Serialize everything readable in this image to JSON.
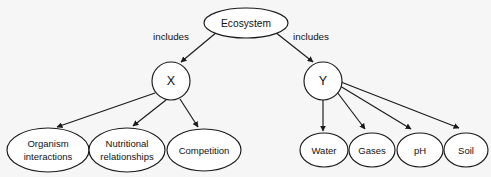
{
  "diagram": {
    "type": "concept-map",
    "background_color": "#f6f6f6",
    "stroke_color": "#1a1a1a",
    "node_fill_color": "#ffffff",
    "text_color": "#111111",
    "root": {
      "id": "ecosystem",
      "label": "Ecosystem",
      "shape": "ellipse",
      "cx": 246,
      "cy": 23,
      "rx": 42,
      "ry": 15
    },
    "branches": [
      {
        "id": "x",
        "label": "X",
        "shape": "circle",
        "cx": 171,
        "cy": 81,
        "r": 19,
        "edge_label": "includes",
        "edge_label_x": 171,
        "edge_label_y": 37
      },
      {
        "id": "y",
        "label": "Y",
        "shape": "circle",
        "cx": 323,
        "cy": 81,
        "r": 19,
        "edge_label": "includes",
        "edge_label_x": 311,
        "edge_label_y": 37
      }
    ],
    "leaves_x": [
      {
        "id": "organism-interactions",
        "lines": [
          "Organism",
          "interactions"
        ],
        "shape": "ellipse",
        "cx": 48,
        "cy": 150,
        "rx": 41,
        "ry": 22
      },
      {
        "id": "nutritional-relationships",
        "lines": [
          "Nutritional",
          "relationships"
        ],
        "shape": "ellipse",
        "cx": 127,
        "cy": 150,
        "rx": 38,
        "ry": 22
      },
      {
        "id": "competition",
        "lines": [
          "Competition"
        ],
        "shape": "ellipse",
        "cx": 204,
        "cy": 150,
        "rx": 37,
        "ry": 21
      }
    ],
    "leaves_y": [
      {
        "id": "water",
        "lines": [
          "Water"
        ],
        "shape": "ellipse",
        "cx": 324,
        "cy": 150,
        "rx": 24,
        "ry": 17
      },
      {
        "id": "gases",
        "lines": [
          "Gases"
        ],
        "shape": "ellipse",
        "cx": 372,
        "cy": 150,
        "rx": 23,
        "ry": 17
      },
      {
        "id": "ph",
        "lines": [
          "pH"
        ],
        "shape": "ellipse",
        "cx": 420,
        "cy": 150,
        "rx": 23,
        "ry": 17
      },
      {
        "id": "soil",
        "lines": [
          "Soil"
        ],
        "shape": "ellipse",
        "cx": 466,
        "cy": 150,
        "rx": 22,
        "ry": 17
      }
    ]
  }
}
